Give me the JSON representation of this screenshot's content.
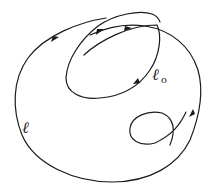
{
  "diagram": {
    "labels": {
      "outer_curve": "ℓ",
      "inner_curve_main": "ℓ",
      "inner_curve_sub": "o"
    },
    "colors": {
      "stroke": "#1a1a1a",
      "background": "#ffffff"
    },
    "arrows": [
      {
        "name": "arrow-outer-left",
        "direction": "up-right"
      },
      {
        "name": "arrow-inner-top",
        "direction": "up-right"
      },
      {
        "name": "arrow-inner-second",
        "direction": "right"
      },
      {
        "name": "arrow-inner-right",
        "direction": "down-left"
      },
      {
        "name": "arrow-outer-right",
        "direction": "down-left"
      }
    ]
  }
}
